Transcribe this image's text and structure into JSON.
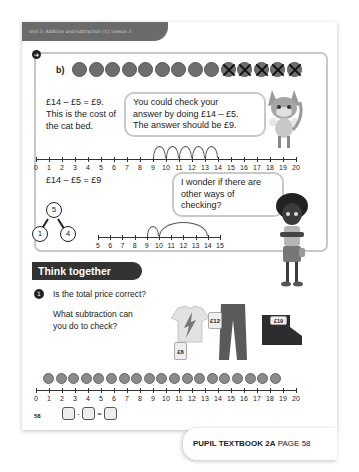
{
  "header": {
    "unit_label": "Unit 2: Addition and subtraction (1), Lesson 2"
  },
  "part_b": {
    "label": "b)",
    "coins_total": 14,
    "coins_crossed": 5,
    "statement_line1": "£14 – £5 = £9.",
    "statement_line2": "This is the cost of",
    "statement_line3": "the cat bed.",
    "fox_bubble_line1": "You could check your",
    "fox_bubble_line2": "answer by doing £14 – £5.",
    "fox_bubble_line3": "The answer should be £9.",
    "numberline1": {
      "start": 0,
      "end": 20,
      "jumps_from": 14,
      "jumps_to": 9,
      "labels": [
        "0",
        "1",
        "2",
        "3",
        "4",
        "5",
        "6",
        "7",
        "8",
        "9",
        "10",
        "11",
        "12",
        "13",
        "14",
        "15",
        "16",
        "17",
        "18",
        "19",
        "20"
      ]
    },
    "equation2": "£14 – £5 = £9",
    "girl_bubble_line1": "I wonder if there are",
    "girl_bubble_line2": "other ways of checking?",
    "part_whole": {
      "whole": "5",
      "part1": "1",
      "part2": "4"
    },
    "numberline2": {
      "start": 5,
      "end": 15,
      "labels": [
        "5",
        "6",
        "7",
        "8",
        "9",
        "10",
        "11",
        "12",
        "13",
        "14",
        "15"
      ]
    }
  },
  "think_together": {
    "title": "Think together",
    "question_number": "1",
    "question_line1": "Is the total price correct?",
    "question_line2": "What subtraction can",
    "question_line3": "you do to check?",
    "prices": {
      "tshirt": "£6",
      "trousers": "£12",
      "total": "£19"
    },
    "coins_count": 19,
    "numberline3": {
      "labels": [
        "0",
        "1",
        "2",
        "3",
        "4",
        "5",
        "6",
        "7",
        "8",
        "9",
        "10",
        "11",
        "12",
        "13",
        "14",
        "15",
        "16",
        "17",
        "18",
        "19",
        "20"
      ]
    },
    "equation_minus": "–",
    "equation_equals": "="
  },
  "page_number": "58",
  "footer": {
    "book": "PUPIL TEXTBOOK 2A",
    "page": "PAGE 58"
  }
}
